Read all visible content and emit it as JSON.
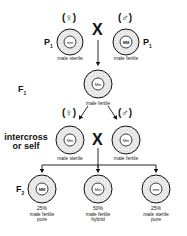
{
  "generations": {
    "p1_left": "P",
    "p1_right": "P",
    "p_sub": "1",
    "f1": "F",
    "f1_sub": "1",
    "f2": "F",
    "f2_sub": "2"
  },
  "symbols": {
    "female": "(♀)",
    "male": "(♂)",
    "cross": "X"
  },
  "parents": [
    {
      "genotype": "mm",
      "phenotype": "male sterile",
      "sex": "female"
    },
    {
      "genotype": "MM",
      "phenotype": "male fertile",
      "sex": "male"
    }
  ],
  "f1": {
    "genotype": "Mm",
    "phenotype": "male fertile"
  },
  "intercross": {
    "label_line1": "intercross",
    "label_line2": "or self",
    "plants": [
      {
        "genotype": "Mm",
        "phenotype": "male sterile"
      },
      {
        "genotype": "Mm",
        "phenotype": "male fertile"
      }
    ]
  },
  "f2": [
    {
      "genotype": "MM",
      "percent": "25%",
      "phenotype": "male fertile",
      "type": "pure"
    },
    {
      "genotype": "Mm",
      "percent": "50%",
      "phenotype": "male fertile",
      "type": "hybrid"
    },
    {
      "genotype": "mm",
      "percent": "25%",
      "phenotype": "male sterile",
      "type": "pure"
    }
  ]
}
